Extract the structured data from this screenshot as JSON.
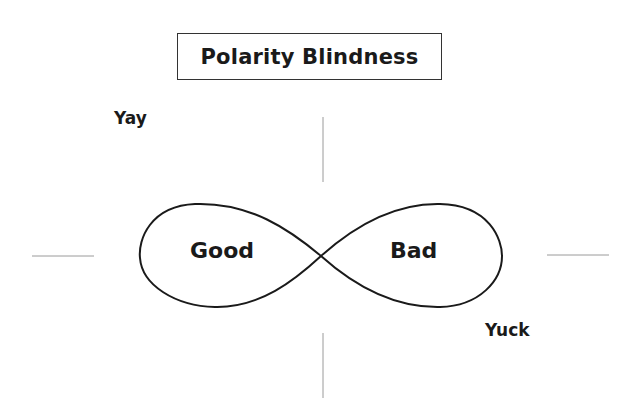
{
  "title": "Polarity Blindness",
  "labels": {
    "top_left": "Yay",
    "bottom_right": "Yuck",
    "left_loop": "Good",
    "right_loop": "Bad"
  },
  "colors": {
    "stroke": "#1a1a1a",
    "axis_lines": "#9a9a9a",
    "background": "#ffffff"
  }
}
